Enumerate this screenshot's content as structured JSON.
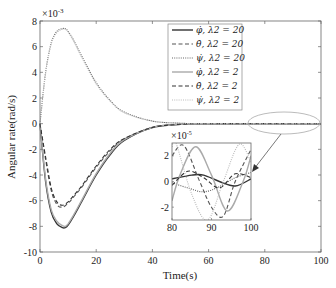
{
  "chart_data": {
    "type": "line",
    "title": "",
    "xlabel": "Time(s)",
    "ylabel": "Angular rate(rad/s)",
    "xlim": [
      0,
      100
    ],
    "ylim": [
      -10,
      8
    ],
    "y_multiplier": "×10^-3",
    "x_ticks": [
      "0",
      "20",
      "40",
      "60",
      "80",
      "100"
    ],
    "y_ticks": [
      "-10",
      "-8",
      "-6",
      "-4",
      "-2",
      "0",
      "2",
      "4",
      "6",
      "8"
    ],
    "grid": false,
    "legend_position": "upper-center",
    "series": [
      {
        "name": "φ̇, λ2 = 20",
        "style": "solid",
        "color": "#333333",
        "x": [
          0,
          2,
          4,
          6,
          8,
          9,
          10,
          12,
          15,
          20,
          25,
          30,
          40,
          50,
          60,
          100
        ],
        "y": [
          0,
          -4.5,
          -6.9,
          -7.8,
          -8.1,
          -8.1,
          -7.9,
          -7.2,
          -6.0,
          -4.0,
          -2.4,
          -1.3,
          -0.3,
          -0.05,
          0,
          0
        ]
      },
      {
        "name": "θ̇, λ2 = 20",
        "style": "dashed",
        "color": "#555555",
        "x": [
          0,
          2,
          4,
          6,
          8,
          10,
          12,
          15,
          20,
          25,
          30,
          40,
          50,
          60,
          100
        ],
        "y": [
          0,
          -2.8,
          -5.2,
          -6.3,
          -6.5,
          -6.2,
          -5.7,
          -4.9,
          -3.4,
          -2.1,
          -1.2,
          -0.3,
          -0.05,
          0,
          0
        ]
      },
      {
        "name": "ψ̇, λ2 = 20",
        "style": "dotted",
        "color": "#666666",
        "x": [
          0,
          2,
          4,
          6,
          8,
          9,
          10,
          12,
          15,
          20,
          25,
          30,
          40,
          50,
          60,
          100
        ],
        "y": [
          0,
          4.0,
          6.3,
          7.2,
          7.4,
          7.4,
          7.2,
          6.5,
          5.2,
          3.2,
          1.8,
          0.9,
          0.2,
          0.04,
          0,
          0
        ]
      },
      {
        "name": "φ̇, λ2 = 2",
        "style": "solid",
        "color": "#aaaaaa",
        "x": [
          0,
          2,
          4,
          6,
          8,
          9,
          10,
          12,
          15,
          20,
          25,
          30,
          40,
          50,
          60,
          100
        ],
        "y": [
          0,
          -4.3,
          -6.7,
          -7.6,
          -7.95,
          -8.0,
          -7.8,
          -7.1,
          -5.9,
          -3.9,
          -2.3,
          -1.25,
          -0.3,
          -0.05,
          0,
          0
        ]
      },
      {
        "name": "θ̇, λ2 = 2",
        "style": "dashed",
        "color": "#333333",
        "x": [
          0,
          2,
          4,
          6,
          8,
          10,
          12,
          15,
          20,
          25,
          30,
          40,
          50,
          60,
          100
        ],
        "y": [
          0,
          -2.6,
          -5.0,
          -6.1,
          -6.35,
          -6.1,
          -5.6,
          -4.8,
          -3.3,
          -2.0,
          -1.15,
          -0.3,
          -0.05,
          0,
          0
        ]
      },
      {
        "name": "ψ̇, λ2 = 2",
        "style": "dotted",
        "color": "#bbbbbb",
        "x": [
          0,
          2,
          4,
          6,
          8,
          9,
          10,
          12,
          15,
          20,
          25,
          30,
          40,
          50,
          60,
          100
        ],
        "y": [
          0,
          3.9,
          6.2,
          7.1,
          7.35,
          7.35,
          7.15,
          6.4,
          5.1,
          3.1,
          1.75,
          0.85,
          0.2,
          0.04,
          0,
          0
        ]
      }
    ],
    "inset": {
      "xlim": [
        80,
        100
      ],
      "ylim": [
        -3,
        3
      ],
      "y_multiplier": "×10^-5",
      "x_ticks": [
        "80",
        "90",
        "100"
      ],
      "y_ticks": [
        "-2",
        "0",
        "2"
      ],
      "series_y_e5": [
        {
          "name": "φ̇, λ2 = 20",
          "x": [
            80,
            85,
            88,
            92,
            96,
            100
          ],
          "y": [
            0.2,
            0.5,
            0.5,
            0.0,
            -0.35,
            0.2
          ]
        },
        {
          "name": "θ̇, λ2 = 20",
          "x": [
            80,
            83,
            87,
            90,
            93,
            96,
            100
          ],
          "y": [
            2.0,
            2.8,
            0.0,
            -2.0,
            -2.7,
            0.0,
            2.5
          ]
        },
        {
          "name": "ψ̇, λ2 = 20",
          "x": [
            80,
            84,
            88,
            92,
            96,
            100
          ],
          "y": [
            -0.1,
            -0.5,
            -0.8,
            -0.4,
            0.3,
            0.7
          ]
        },
        {
          "name": "φ̇, λ2 = 2",
          "x": [
            80,
            82,
            86,
            90,
            94,
            98,
            100
          ],
          "y": [
            -1.5,
            0.5,
            2.7,
            0.5,
            -2.3,
            0.0,
            2.0
          ]
        },
        {
          "name": "θ̇, λ2 = 2",
          "x": [
            80,
            84,
            88,
            92,
            96,
            100
          ],
          "y": [
            -0.3,
            0.8,
            0.3,
            -0.5,
            0.6,
            0.3
          ]
        },
        {
          "name": "ψ̇, λ2 = 2",
          "x": [
            80,
            81,
            85,
            89,
            93,
            97,
            100
          ],
          "y": [
            2.7,
            3.0,
            -1.0,
            -3.0,
            0.0,
            2.9,
            1.5
          ]
        }
      ]
    },
    "annotations": [
      "ellipse around t=80-100 near y=0 with arrow pointing to inset"
    ]
  },
  "labels": {
    "xlabel": "Time(s)",
    "ylabel": "Angular rate(rad/s)",
    "y_mult_base": "×10",
    "y_mult_exp": "-3",
    "inset_mult_base": "×10",
    "inset_mult_exp": "-5"
  }
}
